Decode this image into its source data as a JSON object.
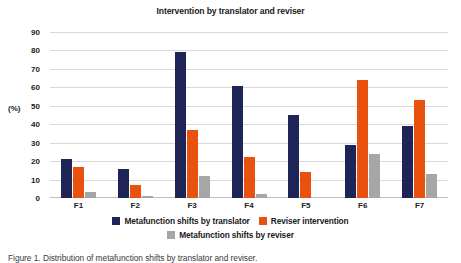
{
  "chart_data": {
    "type": "bar",
    "title": "Intervention by translator and reviser",
    "xlabel": "",
    "ylabel": "(%)",
    "ylim": [
      0,
      90
    ],
    "ytick_step": 10,
    "yticks": [
      90,
      80,
      70,
      60,
      50,
      40,
      30,
      20,
      10,
      0
    ],
    "grid": true,
    "legend_position": "bottom",
    "categories": [
      "F1",
      "F2",
      "F3",
      "F4",
      "F5",
      "F6",
      "F7"
    ],
    "series": [
      {
        "name": "Metafunction shifts by translator",
        "color": "#1F2456",
        "values": [
          21,
          16,
          79,
          61,
          45,
          29,
          39
        ]
      },
      {
        "name": "Reviser intervention",
        "color": "#E8520E",
        "values": [
          17,
          7,
          37,
          22,
          14,
          64,
          53
        ]
      },
      {
        "name": "Metafunction shifts by reviser",
        "color": "#A6A6A6",
        "values": [
          3,
          1,
          12,
          2,
          0,
          24,
          13
        ]
      }
    ]
  },
  "caption": "Figure 1. Distribution of metafunction shifts by translator and reviser."
}
